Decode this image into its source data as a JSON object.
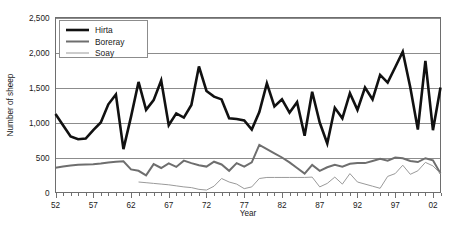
{
  "chart_data": {
    "type": "line",
    "title": "",
    "xlabel": "Year",
    "ylabel": "Number of sheep",
    "xlim": [
      52,
      103
    ],
    "ylim": [
      0,
      2500
    ],
    "yticks": [
      0,
      500,
      1000,
      1500,
      2000,
      2500
    ],
    "ytick_labels": [
      "0",
      "500",
      "1,000",
      "1,500",
      "2,000",
      "2,500"
    ],
    "xticks": [
      52,
      57,
      62,
      67,
      72,
      77,
      82,
      87,
      92,
      97,
      102
    ],
    "xtick_labels": [
      "52",
      "57",
      "62",
      "67",
      "72",
      "77",
      "82",
      "87",
      "92",
      "97",
      "02"
    ],
    "grid": true,
    "grid_axis": "y",
    "legend_position": "top-left",
    "x": [
      52,
      53,
      54,
      55,
      56,
      57,
      58,
      59,
      60,
      61,
      62,
      63,
      64,
      65,
      66,
      67,
      68,
      69,
      70,
      71,
      72,
      73,
      74,
      75,
      76,
      77,
      78,
      79,
      80,
      81,
      82,
      83,
      84,
      85,
      86,
      87,
      88,
      89,
      90,
      91,
      92,
      93,
      94,
      95,
      96,
      97,
      98,
      99,
      100,
      101,
      102,
      103
    ],
    "series": [
      {
        "name": "Hirta",
        "color": "#111111",
        "line_width": 2.6,
        "values": [
          1120,
          960,
          800,
          760,
          770,
          890,
          1000,
          1260,
          1400,
          620,
          1080,
          1580,
          1180,
          1320,
          1600,
          960,
          1130,
          1070,
          1250,
          1800,
          1450,
          1370,
          1330,
          1060,
          1050,
          1030,
          900,
          1150,
          1560,
          1230,
          1330,
          1140,
          1290,
          810,
          1440,
          1000,
          700,
          1210,
          1060,
          1420,
          1180,
          1500,
          1330,
          1680,
          1570,
          1790,
          2010,
          1500,
          900,
          1880,
          890,
          1500
        ]
      },
      {
        "name": "Boreray",
        "color": "#6e6e6e",
        "line_width": 2.0,
        "values": [
          355,
          370,
          385,
          395,
          400,
          405,
          415,
          430,
          440,
          445,
          330,
          310,
          245,
          405,
          350,
          415,
          365,
          455,
          420,
          390,
          370,
          440,
          400,
          310,
          420,
          370,
          430,
          680,
          620,
          560,
          500,
          430,
          350,
          270,
          395,
          310,
          360,
          395,
          370,
          410,
          420,
          420,
          450,
          480,
          455,
          500,
          490,
          450,
          435,
          490,
          460,
          270
        ]
      },
      {
        "name": "Soay",
        "color": "#9a9a9a",
        "line_width": 1.0,
        "values": [
          null,
          null,
          null,
          null,
          null,
          null,
          null,
          null,
          null,
          null,
          null,
          150,
          140,
          130,
          120,
          110,
          95,
          80,
          70,
          45,
          35,
          90,
          200,
          150,
          120,
          55,
          80,
          200,
          215,
          215,
          215,
          215,
          215,
          215,
          220,
          80,
          130,
          220,
          120,
          270,
          150,
          120,
          90,
          60,
          230,
          270,
          390,
          260,
          310,
          430,
          380,
          270
        ]
      }
    ]
  },
  "legend": {
    "items": [
      {
        "label": "Hirta"
      },
      {
        "label": "Boreray"
      },
      {
        "label": "Soay"
      }
    ]
  }
}
